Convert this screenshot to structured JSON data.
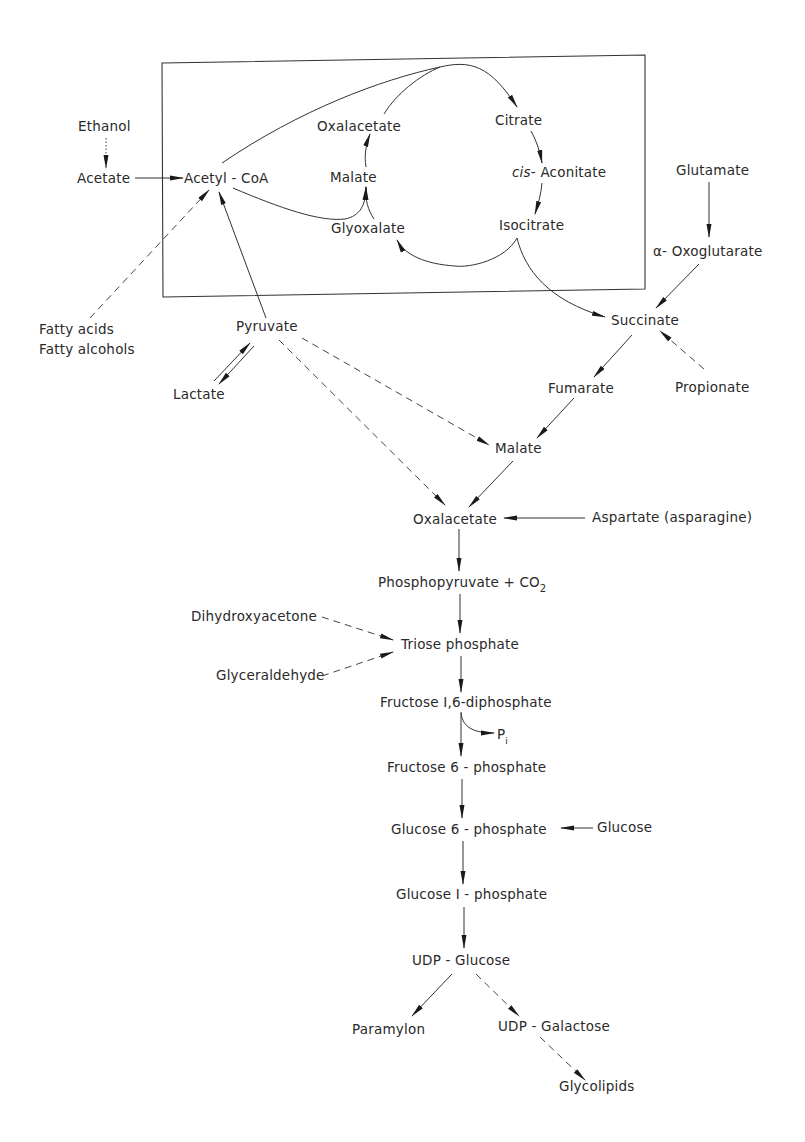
{
  "diagram": {
    "nodes": {
      "ethanol": "Ethanol",
      "acetate": "Acetate",
      "acetyl_coa": "Acetyl - CoA",
      "oxalacetate_box": "Oxalacetate",
      "malate_box": "Malate",
      "glyoxalate": "Glyoxalate",
      "citrate": "Citrate",
      "cis_prefix": "cis",
      "cis_aconitate": "- Aconitate",
      "isocitrate": "Isocitrate",
      "glutamate": "Glutamate",
      "alpha_oxoglutarate": "α- Oxoglutarate",
      "fatty_acids": "Fatty  acids",
      "fatty_alcohols": "Fatty  alcohols",
      "pyruvate": "Pyruvate",
      "lactate": "Lactate",
      "succinate": "Succinate",
      "fumarate": "Fumarate",
      "propionate": "Propionate",
      "malate": "Malate",
      "oxalacetate": "Oxalacetate",
      "aspartate": "Aspartate  (asparagine)",
      "phosphopyruvate": "Phosphopyruvate + CO",
      "phosphopyruvate_sub": "2",
      "dihydroxyacetone": "Dihydroxyacetone",
      "glyceraldehyde": "Glyceraldehyde",
      "triose_phosphate": "Triose  phosphate",
      "fructose_16": "Fructose  I,6-diphosphate",
      "pi": "P",
      "pi_sub": "i",
      "fructose_6": "Fructose  6 - phosphate",
      "glucose_6": "Glucose  6 - phosphate",
      "glucose": "Glucose",
      "glucose_1": "Glucose  I - phosphate",
      "udp_glucose": "UDP - Glucose",
      "paramylon": "Paramylon",
      "udp_galactose": "UDP - Galactose",
      "glycolipids": "Glycolipids"
    },
    "edges": [
      {
        "from": "Ethanol",
        "to": "Acetate",
        "style": "dotted"
      },
      {
        "from": "Acetate",
        "to": "Acetyl-CoA",
        "style": "solid"
      },
      {
        "from": "Acetyl-CoA",
        "to": "Citrate",
        "style": "solid"
      },
      {
        "from": "Oxalacetate",
        "to": "Citrate",
        "style": "solid"
      },
      {
        "from": "Citrate",
        "to": "cis-Aconitate",
        "style": "solid"
      },
      {
        "from": "cis-Aconitate",
        "to": "Isocitrate",
        "style": "solid"
      },
      {
        "from": "Isocitrate",
        "to": "Glyoxalate",
        "style": "solid"
      },
      {
        "from": "Isocitrate",
        "to": "Succinate",
        "style": "solid"
      },
      {
        "from": "Glyoxalate",
        "to": "Malate",
        "style": "solid"
      },
      {
        "from": "Acetyl-CoA",
        "to": "Malate",
        "style": "solid"
      },
      {
        "from": "Malate",
        "to": "Oxalacetate",
        "style": "solid"
      },
      {
        "from": "Fatty acids / Fatty alcohols",
        "to": "Acetyl-CoA",
        "style": "dashed"
      },
      {
        "from": "Pyruvate",
        "to": "Acetyl-CoA",
        "style": "solid"
      },
      {
        "from": "Pyruvate",
        "to": "Lactate",
        "style": "reversible"
      },
      {
        "from": "Glutamate",
        "to": "α-Oxoglutarate",
        "style": "solid"
      },
      {
        "from": "α-Oxoglutarate",
        "to": "Succinate",
        "style": "solid"
      },
      {
        "from": "Propionate",
        "to": "Succinate",
        "style": "dashed"
      },
      {
        "from": "Succinate",
        "to": "Fumarate",
        "style": "solid"
      },
      {
        "from": "Fumarate",
        "to": "Malate",
        "style": "solid"
      },
      {
        "from": "Pyruvate",
        "to": "Malate",
        "style": "dashed"
      },
      {
        "from": "Pyruvate",
        "to": "Oxalacetate",
        "style": "dashed"
      },
      {
        "from": "Malate",
        "to": "Oxalacetate",
        "style": "solid"
      },
      {
        "from": "Aspartate (asparagine)",
        "to": "Oxalacetate",
        "style": "solid"
      },
      {
        "from": "Oxalacetate",
        "to": "Phosphopyruvate + CO2",
        "style": "solid"
      },
      {
        "from": "Phosphopyruvate + CO2",
        "to": "Triose phosphate",
        "style": "solid"
      },
      {
        "from": "Dihydroxyacetone",
        "to": "Triose phosphate",
        "style": "dashed"
      },
      {
        "from": "Glyceraldehyde",
        "to": "Triose phosphate",
        "style": "dashed"
      },
      {
        "from": "Triose phosphate",
        "to": "Fructose 1,6-diphosphate",
        "style": "solid"
      },
      {
        "from": "Fructose 1,6-diphosphate",
        "to": "Pi",
        "style": "solid"
      },
      {
        "from": "Fructose 1,6-diphosphate",
        "to": "Fructose 6-phosphate",
        "style": "solid"
      },
      {
        "from": "Fructose 6-phosphate",
        "to": "Glucose 6-phosphate",
        "style": "solid"
      },
      {
        "from": "Glucose",
        "to": "Glucose 6-phosphate",
        "style": "solid"
      },
      {
        "from": "Glucose 6-phosphate",
        "to": "Glucose 1-phosphate",
        "style": "solid"
      },
      {
        "from": "Glucose 1-phosphate",
        "to": "UDP-Glucose",
        "style": "solid"
      },
      {
        "from": "UDP-Glucose",
        "to": "Paramylon",
        "style": "solid"
      },
      {
        "from": "UDP-Glucose",
        "to": "UDP-Galactose",
        "style": "dashed"
      },
      {
        "from": "UDP-Galactose",
        "to": "Glycolipids",
        "style": "dashed"
      }
    ]
  }
}
